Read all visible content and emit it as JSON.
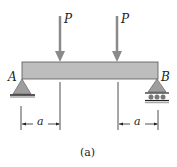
{
  "loads": [
    {
      "label": "P"
    },
    {
      "label": "P"
    }
  ],
  "supports": {
    "left": "A",
    "right": "B"
  },
  "dimensions": [
    {
      "label": "a"
    },
    {
      "label": "a"
    }
  ],
  "caption": "(a)",
  "colors": {
    "beam": "#bdbdbd",
    "arrow": "#8a8a8a",
    "support": "#9e9e9e",
    "line": "#222222"
  }
}
